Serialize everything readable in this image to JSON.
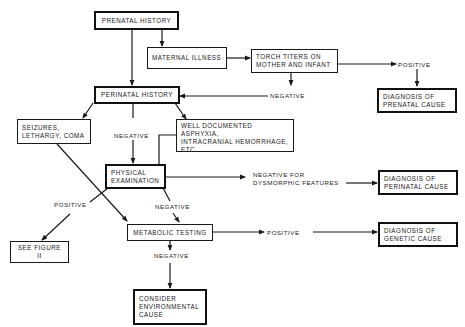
{
  "diagram": {
    "type": "flowchart",
    "colors": {
      "ink": "#1a1a1a",
      "background": "#ffffff"
    },
    "nodes": {
      "prenatal_history": "PRENATAL HISTORY",
      "maternal_illness": "MATERNAL ILLNESS",
      "torch_titers": "TORCH TITERS ON\nMOTHER AND INFANT",
      "diagnosis_prenatal": "DIAGNOSIS OF\nPRENATAL CAUSE",
      "perinatal_history": "PERINATAL HISTORY",
      "seizures": "SEIZURES,\nLETHARGY, COMA",
      "asphyxia": "WELL DOCUMENTED ASPHYXIA,\nINTRACRANIAL HEMORRHAGE,\nETC.",
      "physical_exam": "PHYSICAL\nEXAMINATION",
      "diagnosis_perinatal": "DIAGNOSIS OF\nPERINATAL CAUSE",
      "metabolic_testing": "METABOLIC TESTING",
      "diagnosis_genetic": "DIAGNOSIS OF\nGENETIC CAUSE",
      "see_figure": "SEE FIGURE II",
      "environmental": "CONSIDER\nENVIRONMENTAL\nCAUSE"
    },
    "edge_labels": {
      "torch_positive": "POSITIVE",
      "torch_negative": "NEGATIVE",
      "perinatal_negative": "NEGATIVE",
      "exam_negative_dysmorphic": "NEGATIVE FOR\nDYSMORPHIC FEATURES",
      "exam_positive": "POSITIVE",
      "exam_negative": "NEGATIVE",
      "metabolic_positive": "POSITIVE",
      "metabolic_negative": "NEGATIVE"
    },
    "edges": [
      {
        "from": "prenatal_history",
        "to": "maternal_illness"
      },
      {
        "from": "prenatal_history",
        "to": "perinatal_history"
      },
      {
        "from": "maternal_illness",
        "to": "torch_titers"
      },
      {
        "from": "torch_titers",
        "to": "diagnosis_prenatal",
        "label": "POSITIVE"
      },
      {
        "from": "torch_titers",
        "to": "perinatal_history",
        "label": "NEGATIVE"
      },
      {
        "from": "perinatal_history",
        "to": "seizures"
      },
      {
        "from": "perinatal_history",
        "to": "physical_exam",
        "label": "NEGATIVE"
      },
      {
        "from": "perinatal_history",
        "to": "asphyxia"
      },
      {
        "from": "asphyxia",
        "to": "physical_exam"
      },
      {
        "from": "seizures",
        "to": "metabolic_testing"
      },
      {
        "from": "physical_exam",
        "to": "diagnosis_perinatal",
        "label": "NEGATIVE FOR DYSMORPHIC FEATURES"
      },
      {
        "from": "physical_exam",
        "to": "see_figure",
        "label": "POSITIVE"
      },
      {
        "from": "physical_exam",
        "to": "metabolic_testing",
        "label": "NEGATIVE"
      },
      {
        "from": "metabolic_testing",
        "to": "diagnosis_genetic",
        "label": "POSITIVE"
      },
      {
        "from": "metabolic_testing",
        "to": "environmental",
        "label": "NEGATIVE"
      }
    ]
  }
}
